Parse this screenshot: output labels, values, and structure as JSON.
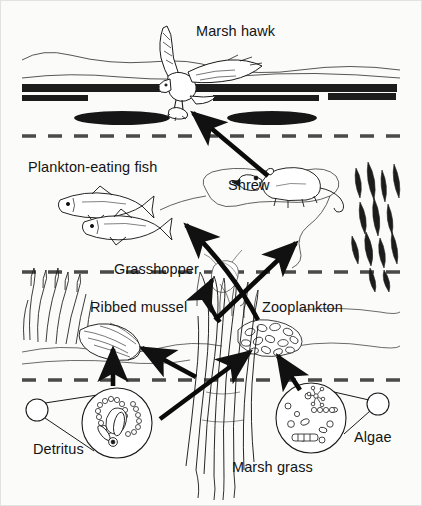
{
  "figure": {
    "background_color": "#fbfbf9",
    "ink_color": "#141414",
    "partial_top_text": ""
  },
  "labels": {
    "marsh_hawk": "Marsh hawk",
    "plankton_eating_fish": "Plankton-eating fish",
    "shrew": "Shrew",
    "grasshopper": "Grasshopper",
    "ribbed_mussel": "Ribbed mussel",
    "zooplankton": "Zooplankton",
    "detritus": "Detritus",
    "marsh_grass": "Marsh grass",
    "algae": "Algae"
  },
  "organisms": [
    {
      "id": "marsh-hawk",
      "label": "Marsh hawk",
      "x": 193,
      "y": 30,
      "role": "top predator"
    },
    {
      "id": "plankton-eating-fish",
      "label": "Plankton-eating fish",
      "x": 30,
      "y": 163,
      "role": "consumer"
    },
    {
      "id": "shrew",
      "label": "Shrew",
      "x": 228,
      "y": 183,
      "role": "consumer"
    },
    {
      "id": "grasshopper",
      "label": "Grasshopper",
      "x": 115,
      "y": 267,
      "role": "consumer"
    },
    {
      "id": "ribbed-mussel",
      "label": "Ribbed mussel",
      "x": 90,
      "y": 305,
      "role": "filter feeder"
    },
    {
      "id": "zooplankton",
      "label": "Zooplankton",
      "x": 264,
      "y": 305,
      "role": "consumer"
    },
    {
      "id": "detritus",
      "label": "Detritus",
      "x": 34,
      "y": 448,
      "role": "decomposing matter"
    },
    {
      "id": "marsh-grass",
      "label": "Marsh grass",
      "x": 233,
      "y": 467,
      "role": "producer"
    },
    {
      "id": "algae",
      "label": "Algae",
      "x": 355,
      "y": 437,
      "role": "producer"
    }
  ],
  "food_web_arrows": [
    {
      "from": "shrew",
      "to": "marsh-hawk"
    },
    {
      "from": "zooplankton",
      "to": "plankton-eating-fish"
    },
    {
      "from": "grasshopper",
      "to": "shrew"
    },
    {
      "from": "marsh-grass",
      "to": "grasshopper"
    },
    {
      "from": "detritus",
      "to": "ribbed-mussel"
    },
    {
      "from": "marsh-grass",
      "to": "ribbed-mussel"
    },
    {
      "from": "detritus",
      "to": "zooplankton"
    },
    {
      "from": "algae",
      "to": "zooplankton"
    }
  ],
  "scene": {
    "dashed_bands": [
      135,
      272,
      379
    ],
    "reeds_right": true,
    "reeds_left": true,
    "water_lines": true
  }
}
